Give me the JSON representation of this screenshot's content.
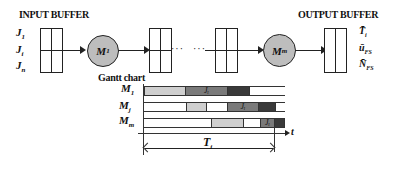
{
  "flow": {
    "input_title": "INPUT BUFFER",
    "output_title": "OUTPUT BUFFER",
    "jobs": [
      {
        "base": "J",
        "sub": "1"
      },
      {
        "base": "J",
        "sub": "i"
      },
      {
        "base": "J",
        "sub": "n"
      }
    ],
    "machines": [
      {
        "base": "M",
        "sub": "1"
      },
      {
        "base": "M",
        "sub": "m"
      }
    ],
    "ellipsis": "···",
    "ellipsis2": "···",
    "output_metrics": [
      {
        "base": "T̄",
        "sub": "i"
      },
      {
        "base": "ū",
        "sub": "FS"
      },
      {
        "base": "N̄",
        "sub": "FS"
      }
    ]
  },
  "gantt": {
    "title": "Gantt chart",
    "axis_label": "t",
    "span_label": {
      "base": "T",
      "sub": "i"
    },
    "colors": {
      "light": "#cfcfcf",
      "mid": "#7a7a7a",
      "dark": "#3a3a3a",
      "empty": "#ffffff"
    },
    "rows": [
      {
        "machine": {
          "base": "M",
          "sub": "1"
        },
        "segments": [
          {
            "start": 0,
            "end": 41,
            "shade": "light",
            "label": ""
          },
          {
            "start": 41,
            "end": 83,
            "shade": "mid",
            "label": "J_i"
          },
          {
            "start": 83,
            "end": 105,
            "shade": "dark",
            "label": ""
          },
          {
            "start": 105,
            "end": 141,
            "shade": "empty",
            "label": ""
          }
        ]
      },
      {
        "machine": {
          "base": "M",
          "sub": "j"
        },
        "segments": [
          {
            "start": 0,
            "end": 42,
            "shade": "empty",
            "label": ""
          },
          {
            "start": 42,
            "end": 62,
            "shade": "light",
            "label": ""
          },
          {
            "start": 62,
            "end": 83,
            "shade": "empty",
            "label": ""
          },
          {
            "start": 83,
            "end": 114,
            "shade": "mid",
            "label": "J_i"
          },
          {
            "start": 114,
            "end": 131,
            "shade": "dark",
            "label": ""
          },
          {
            "start": 131,
            "end": 141,
            "shade": "empty",
            "label": ""
          }
        ]
      },
      {
        "machine": {
          "base": "M",
          "sub": "m"
        },
        "segments": [
          {
            "start": 0,
            "end": 67,
            "shade": "empty",
            "label": ""
          },
          {
            "start": 67,
            "end": 99,
            "shade": "light",
            "label": ""
          },
          {
            "start": 99,
            "end": 116,
            "shade": "empty",
            "label": ""
          },
          {
            "start": 116,
            "end": 130,
            "shade": "mid",
            "label": "J_i"
          },
          {
            "start": 130,
            "end": 139,
            "shade": "dark",
            "label": ""
          }
        ]
      }
    ]
  }
}
